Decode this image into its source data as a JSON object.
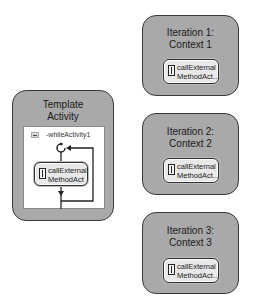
{
  "template": {
    "title_line1": "Template",
    "title_line2": "Activity",
    "while_label": "-whileActivity1",
    "activity": {
      "line1": "callExternal",
      "line2": "MethodAct"
    }
  },
  "iterations": [
    {
      "title_line1": "Iteration 1:",
      "title_line2": "Context 1",
      "activity": {
        "line1": "callExternal",
        "line2": "MethodAct..."
      }
    },
    {
      "title_line1": "Iteration 2:",
      "title_line2": "Context 2",
      "activity": {
        "line1": "callExternal",
        "line2": "MethodAct..."
      }
    },
    {
      "title_line1": "Iteration 3:",
      "title_line2": "Context 3",
      "activity": {
        "line1": "callExternal",
        "line2": "MethodAct..."
      }
    }
  ],
  "colors": {
    "box_fill": "#a9a9a9",
    "box_border": "#3a3a3a",
    "pill_fill": "#e8e8e8",
    "background": "#ffffff"
  }
}
